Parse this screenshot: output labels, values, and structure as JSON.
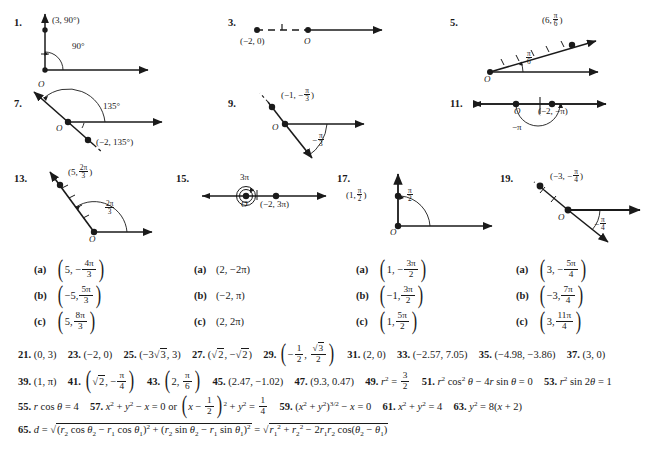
{
  "page": {
    "kind": "textbook-answer-key"
  },
  "diagrams": [
    {
      "number": "1.",
      "origin_label": "O",
      "point_label": "(3, 90°)",
      "angle_label": "90°"
    },
    {
      "number": "3.",
      "origin_label": "O",
      "point_label": "(−2, 0)",
      "angle_label": ""
    },
    {
      "number": "5.",
      "origin_label": "O",
      "point_label_r": "(6,",
      "point_label_num": "π",
      "point_label_den": "6",
      "angle_num": "π",
      "angle_den": "6"
    },
    {
      "number": "7.",
      "origin_label": "O",
      "point_label": "(−2, 135°)",
      "angle_label": "135°"
    },
    {
      "number": "9.",
      "origin_label": "O",
      "point_label_r": "(−1, −",
      "point_label_num": "π",
      "point_label_den": "3",
      "angle_sign": "−",
      "angle_num": "π",
      "angle_den": "3"
    },
    {
      "number": "11.",
      "origin_label": "O",
      "point_label": "(−2, −π)",
      "angle_label": "−π"
    },
    {
      "number": "13.",
      "origin_label": "O",
      "point_label_r": "(5,",
      "point_label_num": "2π",
      "point_label_den": "3",
      "angle_num": "2π",
      "angle_den": "3"
    },
    {
      "number": "15.",
      "origin_label": "O",
      "point_label": "(−2, 3π)",
      "angle_label": "3π"
    },
    {
      "number": "17.",
      "origin_label": "O",
      "point_label_r": "(1,",
      "point_label_num": "π",
      "point_label_den": "2",
      "angle_num": "π",
      "angle_den": "2"
    },
    {
      "number": "19.",
      "origin_label": "O",
      "point_label_r": "(−3, −",
      "point_label_num": "π",
      "point_label_den": "4",
      "angle_sign": "−",
      "angle_num": "π",
      "angle_den": "4"
    }
  ],
  "choice_groups": [
    {
      "for_problem": "13",
      "items": [
        {
          "tag": "(a)",
          "r": "5,",
          "sign": "−",
          "num": "4π",
          "den": "3"
        },
        {
          "tag": "(b)",
          "r": "−5,",
          "sign": "",
          "num": "5π",
          "den": "3"
        },
        {
          "tag": "(c)",
          "r": "5,",
          "sign": "",
          "num": "8π",
          "den": "3"
        }
      ]
    },
    {
      "for_problem": "15",
      "items": [
        {
          "tag": "(a)",
          "plain": "(2, −2π)"
        },
        {
          "tag": "(b)",
          "plain": "(−2, π)"
        },
        {
          "tag": "(c)",
          "plain": "(2, 2π)"
        }
      ]
    },
    {
      "for_problem": "17",
      "items": [
        {
          "tag": "(a)",
          "r": "1,",
          "sign": "−",
          "num": "3π",
          "den": "2"
        },
        {
          "tag": "(b)",
          "r": "−1,",
          "sign": "",
          "num": "3π",
          "den": "2"
        },
        {
          "tag": "(c)",
          "r": "1,",
          "sign": "",
          "num": "5π",
          "den": "2"
        }
      ]
    },
    {
      "for_problem": "19",
      "items": [
        {
          "tag": "(a)",
          "r": "3,",
          "sign": "−",
          "num": "5π",
          "den": "4"
        },
        {
          "tag": "(b)",
          "r": "−3,",
          "sign": "",
          "num": "7π",
          "den": "4"
        },
        {
          "tag": "(c)",
          "r": "3,",
          "sign": "",
          "num": "11π",
          "den": "4"
        }
      ]
    }
  ],
  "answers": {
    "line1": [
      {
        "n": "21.",
        "a": "(0, 3)"
      },
      {
        "n": "23.",
        "a": "(−2, 0)"
      },
      {
        "n": "25.",
        "a": "(−3√3, 3)"
      },
      {
        "n": "27.",
        "a": "(√2, −√2)"
      },
      {
        "n": "29.",
        "a": "(−1/2, √3/2)"
      },
      {
        "n": "31.",
        "a": "(2, 0)"
      },
      {
        "n": "33.",
        "a": "(−2.57, 7.05)"
      },
      {
        "n": "35.",
        "a": "(−4.98, −3.86)"
      },
      {
        "n": "37.",
        "a": "(3, 0)"
      }
    ],
    "line2": [
      {
        "n": "39.",
        "a": "(1, π)"
      },
      {
        "n": "41.",
        "a": "(√2, −π/4)"
      },
      {
        "n": "43.",
        "a": "(2, π/6)"
      },
      {
        "n": "45.",
        "a": "(2.47, −1.02)"
      },
      {
        "n": "47.",
        "a": "(9.3, 0.47)"
      },
      {
        "n": "49.",
        "a": "r² = 3/2"
      },
      {
        "n": "51.",
        "a": "r² cos² θ − 4r sin θ = 0"
      },
      {
        "n": "53.",
        "a": "r² sin 2θ = 1"
      }
    ],
    "line3": [
      {
        "n": "55.",
        "a": "r cos θ = 4"
      },
      {
        "n": "57.",
        "a": "x² + y² − x = 0 or (x − 1/2)² + y² = 1/4"
      },
      {
        "n": "59.",
        "a": "(x² + y²)³ᐟ² − x = 0"
      },
      {
        "n": "61.",
        "a": "x² + y² = 4"
      },
      {
        "n": "63.",
        "a": "y² = 8(x + 2)"
      }
    ],
    "line4": {
      "n": "65.",
      "a": "d = √((r₂ cos θ₂ − r₁ cos θ₁)² + (r₂ sin θ₂ − r₁ sin θ₁)²) = √(r₁² + r₂² − 2r₁r₂ cos(θ₂ − θ₁))"
    }
  },
  "colors": {
    "ink": "#1a1a1a",
    "paper": "#ffffff"
  }
}
